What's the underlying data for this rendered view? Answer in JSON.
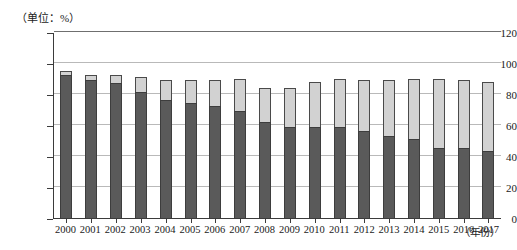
{
  "unit_label": "（单位：%）",
  "axis_title_x": "（年份）",
  "colors": {
    "segment_lower": "#5a5a5a",
    "segment_upper": "#d2d2d2",
    "axis": "#3b3b3b",
    "grid": "#b9b9b9"
  },
  "chart_data": {
    "type": "bar",
    "stacked": true,
    "title": "",
    "subtitle": "",
    "xlabel": "（年份）",
    "ylabel": "（单位：%）",
    "ylim": [
      0,
      120
    ],
    "yticks": [
      0,
      20,
      40,
      60,
      80,
      100,
      120
    ],
    "ytick_labels": [
      "0",
      "20",
      "40",
      "60",
      "80",
      "100",
      "120"
    ],
    "grid": true,
    "legend": "none",
    "categories": [
      "2000",
      "2001",
      "2002",
      "2003",
      "2004",
      "2005",
      "2006",
      "2007",
      "2008",
      "2009",
      "2010",
      "2011",
      "2012",
      "2013",
      "2014",
      "2015",
      "2016",
      "2017"
    ],
    "series": [
      {
        "name": "下段（深灰）",
        "color": "#5a5a5a",
        "values": [
          92,
          89,
          87,
          81,
          76,
          74,
          72,
          69,
          62,
          59,
          59,
          59,
          56,
          53,
          51,
          45,
          45,
          43
        ]
      },
      {
        "name": "上段（浅灰）",
        "color": "#d2d2d2",
        "values": [
          3,
          3,
          5,
          10,
          13,
          15,
          17,
          21,
          22,
          25,
          29,
          31,
          33,
          36,
          39,
          45,
          44,
          45
        ]
      }
    ],
    "totals": [
      95,
      92,
      92,
      91,
      89,
      89,
      89,
      90,
      84,
      84,
      88,
      90,
      89,
      89,
      90,
      90,
      89,
      88
    ]
  }
}
